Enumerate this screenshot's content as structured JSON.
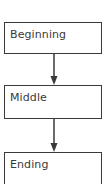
{
  "diagram": {
    "type": "flowchart",
    "direction": "top-to-bottom",
    "nodes": [
      {
        "id": "beginning",
        "label": "Beginning"
      },
      {
        "id": "middle",
        "label": "Middle"
      },
      {
        "id": "ending",
        "label": "Ending"
      }
    ],
    "edges": [
      {
        "from": "beginning",
        "to": "middle"
      },
      {
        "from": "middle",
        "to": "ending"
      }
    ],
    "colors": {
      "stroke": "#3a3a3a",
      "text": "#3a3a3a",
      "background": "#ffffff"
    }
  }
}
